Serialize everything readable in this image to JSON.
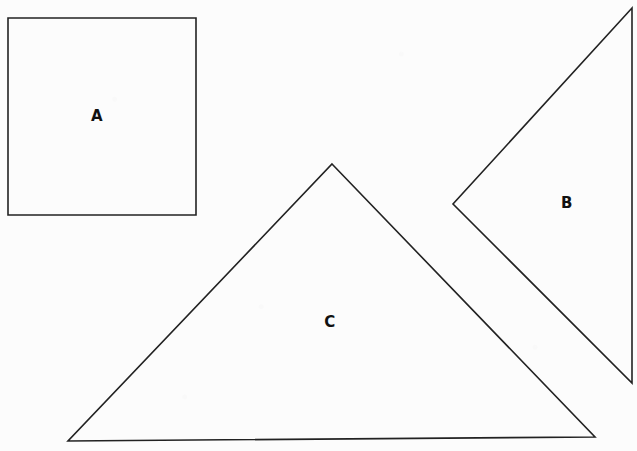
{
  "figure": {
    "width": 637,
    "height": 451,
    "background_color": "#fcfcfc",
    "stroke_color": "#222222",
    "label_color": "#111111",
    "stroke_width": 1.6
  },
  "shapes": [
    {
      "id": "square-a",
      "label": "A",
      "type": "square",
      "points": "8,18 196,18 196,215 8,215",
      "label_x": 97,
      "label_y": 116
    },
    {
      "id": "triangle-b",
      "label": "B",
      "type": "triangle",
      "points": "632,8 632,383 453,204",
      "label_x": 567,
      "label_y": 203
    },
    {
      "id": "triangle-c",
      "label": "C",
      "type": "triangle",
      "points": "332,164 595,437 68,441",
      "label_x": 330,
      "label_y": 322
    }
  ]
}
